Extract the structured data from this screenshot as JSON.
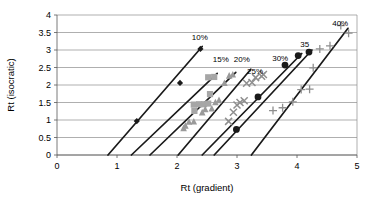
{
  "chart_data": {
    "type": "scatter",
    "title": "",
    "xlabel": "Rt (gradient)",
    "ylabel": "Rt (isocratic)",
    "xlim": [
      0,
      5
    ],
    "ylim": [
      0,
      4
    ],
    "xticks": [
      "0",
      "1",
      "2",
      "3",
      "4",
      "5"
    ],
    "yticks": [
      "0",
      "0.5",
      "1",
      "1.5",
      "2",
      "2.5",
      "3",
      "3.5",
      "4"
    ],
    "grid": "horizontal",
    "legend_position": "inline-annotations",
    "annotations": [
      {
        "text": "10%",
        "x": 2.38,
        "y": 3.28
      },
      {
        "text": "15%",
        "x": 2.73,
        "y": 2.66
      },
      {
        "text": "20%",
        "x": 3.08,
        "y": 2.66
      },
      {
        "text": "25%",
        "x": 3.3,
        "y": 2.32
      },
      {
        "text": "30%",
        "x": 3.72,
        "y": 2.7
      },
      {
        "text": "35",
        "x": 4.13,
        "y": 3.08
      },
      {
        "text": "40%",
        "x": 4.72,
        "y": 3.7
      }
    ],
    "series": [
      {
        "name": "10%",
        "marker": "diamond",
        "color": "#1a1a1a",
        "points": [
          [
            1.33,
            0.97
          ],
          [
            2.05,
            2.06
          ],
          [
            2.39,
            3.03
          ]
        ],
        "fit": {
          "x1": 0.85,
          "y1": 0.0,
          "x2": 2.42,
          "y2": 3.1
        }
      },
      {
        "name": "15%",
        "marker": "square",
        "color": "#a6a6a6",
        "points": [
          [
            2.29,
            1.26
          ],
          [
            2.37,
            1.45
          ],
          [
            2.45,
            1.45
          ],
          [
            2.52,
            1.47
          ],
          [
            2.55,
            1.74
          ],
          [
            2.52,
            2.22
          ],
          [
            2.62,
            2.23
          ],
          [
            2.28,
            1.44
          ]
        ],
        "fit": {
          "x1": 1.24,
          "y1": 0.0,
          "x2": 2.67,
          "y2": 2.33
        }
      },
      {
        "name": "20%",
        "marker": "triangle",
        "color": "#9a9a9a",
        "points": [
          [
            2.11,
            0.77
          ],
          [
            2.14,
            0.84
          ],
          [
            2.2,
            0.95
          ],
          [
            2.28,
            0.96
          ],
          [
            2.42,
            1.22
          ],
          [
            2.47,
            1.31
          ],
          [
            2.58,
            1.33
          ],
          [
            2.64,
            1.51
          ],
          [
            2.7,
            1.57
          ],
          [
            2.79,
            2.06
          ],
          [
            2.87,
            2.27
          ],
          [
            2.93,
            2.3
          ]
        ],
        "fit": {
          "x1": 1.55,
          "y1": 0.0,
          "x2": 2.98,
          "y2": 2.36
        }
      },
      {
        "name": "25%",
        "marker": "cross",
        "color": "#8f8f8f",
        "points": [
          [
            2.86,
            0.96
          ],
          [
            2.94,
            1.22
          ],
          [
            3.0,
            1.43
          ],
          [
            3.05,
            1.5
          ],
          [
            3.12,
            1.55
          ],
          [
            3.16,
            2.05
          ],
          [
            3.25,
            2.07
          ],
          [
            3.31,
            2.21
          ],
          [
            3.41,
            2.25
          ],
          [
            3.44,
            2.3
          ]
        ],
        "fit": {
          "x1": 2.02,
          "y1": 0.0,
          "x2": 3.23,
          "y2": 2.45
        }
      },
      {
        "name": "30%",
        "marker": "circle",
        "color": "#1a1a1a",
        "points": [
          [
            2.99,
            0.73
          ],
          [
            3.35,
            1.66
          ],
          [
            3.8,
            2.57
          ],
          [
            4.02,
            2.84
          ]
        ],
        "fit": {
          "x1": 2.42,
          "y1": 0.0,
          "x2": 4.08,
          "y2": 2.9
        }
      },
      {
        "name": "35",
        "marker": "circle",
        "color": "#1a1a1a",
        "points": [
          [
            4.2,
            2.94
          ]
        ],
        "fit": {
          "x1": 2.62,
          "y1": 0.0,
          "x2": 4.25,
          "y2": 3.0
        }
      },
      {
        "name": "40%",
        "marker": "plus",
        "color": "#8f8f8f",
        "points": [
          [
            3.6,
            1.27
          ],
          [
            3.76,
            1.35
          ],
          [
            3.93,
            1.52
          ],
          [
            4.07,
            1.87
          ],
          [
            4.21,
            1.88
          ],
          [
            4.27,
            2.49
          ],
          [
            4.38,
            3.03
          ],
          [
            4.55,
            3.12
          ],
          [
            4.73,
            3.7
          ],
          [
            4.86,
            3.48
          ]
        ],
        "fit": {
          "x1": 3.24,
          "y1": 0.0,
          "x2": 4.85,
          "y2": 3.62
        }
      }
    ]
  }
}
